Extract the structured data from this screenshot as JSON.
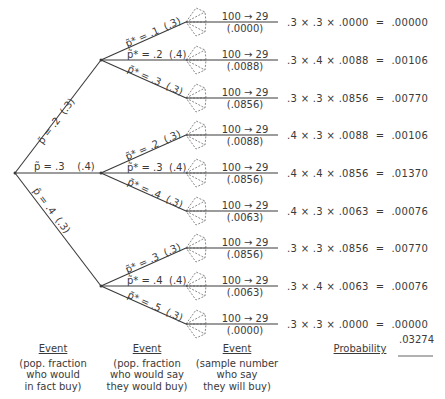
{
  "diagram": {
    "type": "probability-tree",
    "level1": [
      {
        "label": "p̃ = .2",
        "prob": "(.3)"
      },
      {
        "label": "p̃ = .3",
        "prob": "(.4)"
      },
      {
        "label": "p̃ = .4",
        "prob": "(.3)"
      }
    ],
    "level2": [
      [
        {
          "label": "p̃* = .1",
          "prob": "(.3)"
        },
        {
          "label": "p̃* = .2",
          "prob": "(.4)"
        },
        {
          "label": "p̃* = .3",
          "prob": "(.3)"
        }
      ],
      [
        {
          "label": "p̃* = .2",
          "prob": "(.3)"
        },
        {
          "label": "p̃* = .3",
          "prob": "(.4)"
        },
        {
          "label": "p̃* = .4",
          "prob": "(.3)"
        }
      ],
      [
        {
          "label": "p̃* = .3",
          "prob": "(.3)"
        },
        {
          "label": "p̃* = .4",
          "prob": "(.4)"
        },
        {
          "label": "p̃* = .5",
          "prob": "(.3)"
        }
      ]
    ],
    "outcomes": [
      {
        "sample": "100 → 29",
        "likelihood": "(.0000)"
      },
      {
        "sample": "100 → 29",
        "likelihood": "(.0088)"
      },
      {
        "sample": "100 → 29",
        "likelihood": "(.0856)"
      },
      {
        "sample": "100 → 29",
        "likelihood": "(.0088)"
      },
      {
        "sample": "100 → 29",
        "likelihood": "(.0856)"
      },
      {
        "sample": "100 → 29",
        "likelihood": "(.0063)"
      },
      {
        "sample": "100 → 29",
        "likelihood": "(.0856)"
      },
      {
        "sample": "100 → 29",
        "likelihood": "(.0063)"
      },
      {
        "sample": "100 → 29",
        "likelihood": "(.0000)"
      }
    ],
    "products": [
      {
        "a": ".3",
        "b": ".3",
        "c": ".0000",
        "result": ".00000"
      },
      {
        "a": ".3",
        "b": ".4",
        "c": ".0088",
        "result": ".00106"
      },
      {
        "a": ".3",
        "b": ".3",
        "c": ".0856",
        "result": ".00770"
      },
      {
        "a": ".4",
        "b": ".3",
        "c": ".0088",
        "result": ".00106"
      },
      {
        "a": ".4",
        "b": ".4",
        "c": ".0856",
        "result": ".01370"
      },
      {
        "a": ".4",
        "b": ".3",
        "c": ".0063",
        "result": ".00076"
      },
      {
        "a": ".3",
        "b": ".3",
        "c": ".0856",
        "result": ".00770"
      },
      {
        "a": ".3",
        "b": ".4",
        "c": ".0063",
        "result": ".00076"
      },
      {
        "a": ".3",
        "b": ".3",
        "c": ".0000",
        "result": ".00000"
      }
    ],
    "operators": {
      "times": "×",
      "equals": "="
    },
    "total": ".03274",
    "footer": [
      {
        "head": "Event",
        "lines": [
          "(pop. fraction",
          "who would",
          "in fact buy)"
        ]
      },
      {
        "head": "Event",
        "lines": [
          "(pop. fraction",
          "who would say",
          "they would buy)"
        ]
      },
      {
        "head": "Event",
        "lines": [
          "(sample number",
          "who say",
          "they will buy)"
        ]
      },
      {
        "head": "Probability",
        "lines": []
      }
    ]
  }
}
